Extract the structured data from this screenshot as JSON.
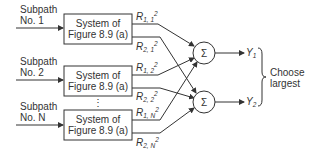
{
  "diagram": {
    "subpaths": [
      {
        "label_line1": "Subpath",
        "label_line2": "No. 1",
        "box_line1": "System of",
        "box_line2": "Figure 8.9 (a)",
        "out1_sub": "1, 1",
        "out2_sub": "2, 1"
      },
      {
        "label_line1": "Subpath",
        "label_line2": "No. 2",
        "box_line1": "System of",
        "box_line2": "Figure 8.9 (a)",
        "out1_sub": "1, 2",
        "out2_sub": "2, 2"
      },
      {
        "label_line1": "Subpath",
        "label_line2": "No. N",
        "box_line1": "System of",
        "box_line2": "Figure 8.9 (a)",
        "out1_sub": "1, N",
        "out2_sub": "2, N"
      }
    ],
    "signal_symbol": "R",
    "exponent": "2",
    "ellipsis": "⋮",
    "summers": [
      {
        "symbol": "Σ",
        "output": "Y",
        "output_sub": "1"
      },
      {
        "symbol": "Σ",
        "output": "Y",
        "output_sub": "2"
      }
    ],
    "decision_line1": "Choose",
    "decision_line2": "largest",
    "line_color": "#333333"
  }
}
